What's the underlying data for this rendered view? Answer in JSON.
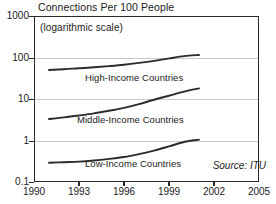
{
  "chart_data": {
    "type": "line",
    "title": "Connections Per 100 People",
    "subtitle": "(logarithmic scale)",
    "xlabel": "",
    "ylabel": "",
    "scale": "logarithmic",
    "grid": true,
    "legend_position": "inline-on-curve",
    "xlim": [
      1990,
      2005
    ],
    "ylim": [
      0.1,
      1000
    ],
    "xticks": [
      1990,
      1993,
      1996,
      1999,
      2002,
      2005
    ],
    "yticks": [
      0.1,
      1,
      10,
      100,
      1000
    ],
    "ytick_labels": [
      "0.1",
      "1",
      "10",
      "100",
      "1000"
    ],
    "xtick_labels": [
      "1990",
      "1993",
      "1996",
      "1999",
      "2002",
      "2005"
    ],
    "annotation": "Source: ITU",
    "series": [
      {
        "name": "High-Income Countries",
        "x": [
          1991,
          1992,
          1993,
          1994,
          1995,
          1996,
          1997,
          1998,
          1999,
          2000,
          2001
        ],
        "values": [
          50,
          52,
          55,
          58,
          62,
          67,
          74,
          83,
          95,
          108,
          115
        ]
      },
      {
        "name": "Middle-Income Countries",
        "x": [
          1991,
          1992,
          1993,
          1994,
          1995,
          1996,
          1997,
          1998,
          1999,
          2000,
          2001
        ],
        "values": [
          3.3,
          3.6,
          4.0,
          4.5,
          5.2,
          6.1,
          7.5,
          9.6,
          12.0,
          15.0,
          18.0
        ]
      },
      {
        "name": "Low-Income Countries",
        "x": [
          1991,
          1992,
          1993,
          1994,
          1995,
          1996,
          1997,
          1998,
          1999,
          2000,
          2001
        ],
        "values": [
          0.29,
          0.3,
          0.31,
          0.33,
          0.36,
          0.4,
          0.47,
          0.57,
          0.72,
          0.92,
          1.05
        ]
      }
    ],
    "series_label_positions": [
      {
        "label": "High-Income Countries",
        "left": 85,
        "top": 72
      },
      {
        "label": "Middle-Income Countries",
        "left": 77,
        "top": 114
      },
      {
        "label": "Low-Income Countries",
        "left": 85,
        "top": 158
      }
    ]
  },
  "colors": {
    "curve": "#2b2b2b",
    "grid": "#c9c9c9",
    "frame": "#2a2a2a",
    "text": "#1a1a1a",
    "background": "#ffffff"
  },
  "geometry": {
    "plot_left": 34,
    "plot_top": 16,
    "plot_width": 225,
    "plot_height": 166
  }
}
